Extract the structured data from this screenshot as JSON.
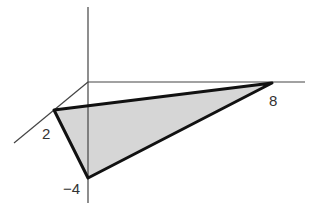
{
  "diagram": {
    "type": "3d-coordinate-plane-triangle",
    "fill_color": "#d6d6d6",
    "edge_color": "#111111",
    "axis_color": "#444444",
    "axes": {
      "z_axis": {
        "x1": 88,
        "y1": 7,
        "x2": 88,
        "y2": 203
      },
      "y_axis": {
        "x1": 88,
        "y1": 82,
        "x2": 305,
        "y2": 82
      },
      "x_axis": {
        "x1": 88,
        "y1": 82,
        "x2": 14,
        "y2": 143
      }
    },
    "vertices": [
      {
        "name": "x-intercept",
        "label": "2",
        "px": 54,
        "py": 110
      },
      {
        "name": "y-intercept",
        "label": "8",
        "px": 272,
        "py": 83
      },
      {
        "name": "z-intercept",
        "label": "−4",
        "px": 88,
        "py": 178
      }
    ],
    "labels": {
      "x_intercept": "2",
      "y_intercept": "8",
      "z_intercept": "−4"
    }
  }
}
